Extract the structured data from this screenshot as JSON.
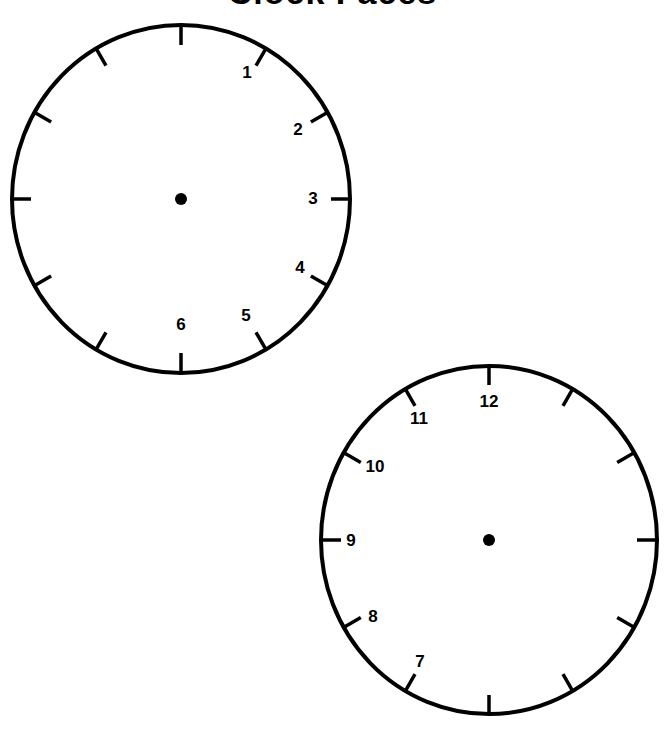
{
  "page": {
    "title": "Clock Faces",
    "title_note_visible_fragment_only": true
  },
  "colors": {
    "background": "#ffffff",
    "ink": "#000000"
  },
  "clocks": [
    {
      "id": "clock-right-half",
      "center": [
        181,
        199
      ],
      "radius": [
        170,
        174
      ],
      "visible_numerals": [
        {
          "label": "1",
          "x": 247,
          "y": 72
        },
        {
          "label": "2",
          "x": 298,
          "y": 129
        },
        {
          "label": "3",
          "x": 313,
          "y": 198
        },
        {
          "label": "4",
          "x": 300,
          "y": 267
        },
        {
          "label": "5",
          "x": 246,
          "y": 315
        },
        {
          "label": "6",
          "x": 181,
          "y": 324
        }
      ]
    },
    {
      "id": "clock-left-half",
      "center": [
        489,
        540
      ],
      "radius": [
        168,
        175
      ],
      "visible_numerals": [
        {
          "label": "7",
          "x": 420,
          "y": 661
        },
        {
          "label": "8",
          "x": 373,
          "y": 616
        },
        {
          "label": "9",
          "x": 351,
          "y": 540
        },
        {
          "label": "10",
          "x": 375,
          "y": 466
        },
        {
          "label": "11",
          "x": 419,
          "y": 418
        },
        {
          "label": "12",
          "x": 489,
          "y": 401
        }
      ]
    }
  ]
}
